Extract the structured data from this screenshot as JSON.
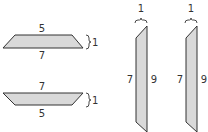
{
  "colors": {
    "fill": "#d9d9d9",
    "stroke": "#333333",
    "text": "#333333"
  },
  "figures": [
    {
      "id": "trapezoid-top",
      "shape": "trapezoid",
      "orientation": "short side up",
      "top_label": "5",
      "bottom_label": "7",
      "height_label": "1"
    },
    {
      "id": "trapezoid-bottom",
      "shape": "trapezoid",
      "orientation": "long side up",
      "top_label": "7",
      "bottom_label": "5",
      "height_label": "1"
    },
    {
      "id": "parallelogram-left",
      "shape": "vertical trapezoid",
      "width_label": "1",
      "left_label": "7",
      "right_label": "9"
    },
    {
      "id": "parallelogram-right",
      "shape": "vertical trapezoid",
      "width_label": "1",
      "left_label": "7",
      "right_label": "9"
    }
  ]
}
